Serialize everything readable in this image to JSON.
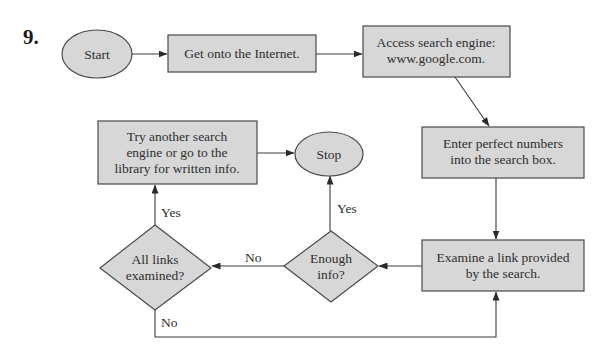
{
  "problem_number": "9.",
  "colors": {
    "shape_fill": "#d7d7d7",
    "stroke": "#4a4a4a",
    "text": "#2e2e2e"
  },
  "nodes": {
    "start": {
      "type": "ellipse",
      "label": "Start"
    },
    "get_online": {
      "type": "process",
      "lines": [
        "Get onto the Internet."
      ]
    },
    "access_engine": {
      "type": "process",
      "lines": [
        "Access search engine:",
        "www.google.com."
      ]
    },
    "enter_numbers": {
      "type": "process",
      "lines": [
        "Enter perfect numbers",
        "into the search box."
      ]
    },
    "examine_link": {
      "type": "process",
      "lines": [
        "Examine a link provided",
        "by the search."
      ]
    },
    "enough_info": {
      "type": "decision",
      "lines": [
        "Enough",
        "info?"
      ]
    },
    "all_links": {
      "type": "decision",
      "lines": [
        "All links",
        "examined?"
      ]
    },
    "try_another": {
      "type": "process",
      "lines": [
        "Try another search",
        "engine or go to the",
        "library for written info."
      ]
    },
    "stop": {
      "type": "ellipse",
      "label": "Stop"
    }
  },
  "edges": {
    "enough_yes": "Yes",
    "enough_no": "No",
    "all_links_yes": "Yes",
    "all_links_no": "No"
  }
}
